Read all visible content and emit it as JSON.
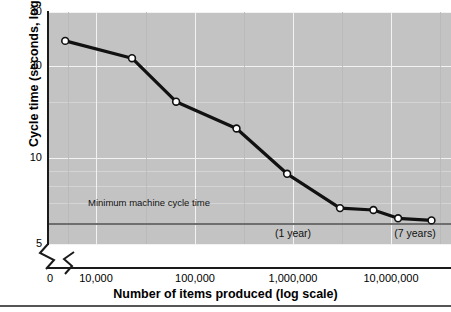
{
  "chart_data": {
    "type": "line",
    "title": "",
    "xlabel": "Number of items produced (log scale)",
    "ylabel": "Cycle time (seconds, log scale)",
    "x_scale": "log",
    "y_scale": "log",
    "xlim": [
      7000,
      30000000
    ],
    "ylim": [
      5,
      30
    ],
    "grid": true,
    "legend": null,
    "x_ticks": [
      "0",
      "10,000",
      "100,000",
      "1,000,000",
      "10,000,000"
    ],
    "y_ticks": [
      "30",
      "20",
      "10",
      "5"
    ],
    "series": [
      {
        "name": "Cycle time",
        "marker": "open-circle",
        "color": "#111111",
        "x": [
          10000,
          40000,
          100000,
          350000,
          1000000,
          3000000,
          6000000,
          10000000,
          20000000
        ],
        "y": [
          24,
          21,
          15,
          12.2,
          8.6,
          6.6,
          6.5,
          6.1,
          6.0
        ]
      }
    ],
    "reference_line": {
      "label": "Minimum machine cycle time",
      "value": 5.9,
      "color": "#6e6e6e"
    },
    "annotations": [
      {
        "text": "(1 year)",
        "x": 1000000
      },
      {
        "text": "(7 years)",
        "x": 8000000
      }
    ]
  },
  "axes": {
    "y_title": "Cycle time (seconds, log scale)",
    "x_title": "Number of items produced (log scale)",
    "y_labels": [
      "30",
      "20",
      "10",
      "5"
    ],
    "x_labels": [
      "0",
      "10,000",
      "100,000",
      "1,000,000",
      "10,000,000"
    ]
  },
  "reference": {
    "label": "Minimum machine cycle time"
  },
  "notes": {
    "one_year": "(1 year)",
    "seven_years": "(7 years)"
  },
  "colors": {
    "panel": "#c3c3c3",
    "gridline": "#f2f2f2",
    "series": "#111111",
    "reference_line": "#6e6e6e",
    "axis": "#1a1a1a"
  }
}
